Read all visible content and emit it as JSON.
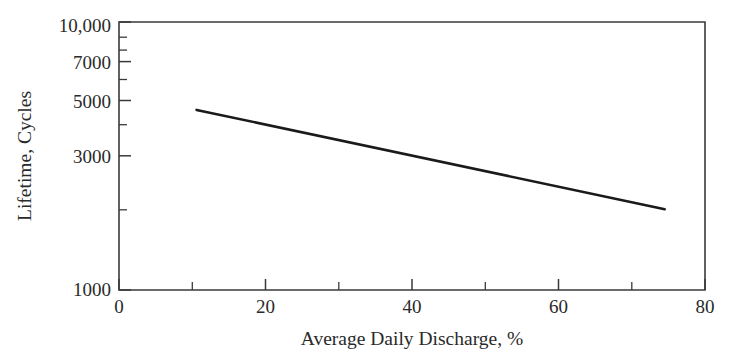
{
  "chart_data": {
    "type": "line",
    "title": "",
    "xlabel": "Average Daily Discharge, %",
    "ylabel": "Lifetime, Cycles",
    "xlim": [
      0,
      80
    ],
    "ylim": [
      1000,
      10000
    ],
    "yscale": "log",
    "xscale": "linear",
    "grid": false,
    "legend": null,
    "xticks": [
      0,
      20,
      40,
      60,
      80
    ],
    "xtick_labels": [
      "0",
      "20",
      "40",
      "60",
      "80"
    ],
    "xticks_minor": [
      10,
      30,
      50,
      70
    ],
    "yticks": [
      1000,
      3000,
      5000,
      7000,
      10000
    ],
    "ytick_labels": [
      "1000",
      "3000",
      "5000",
      "7000",
      "10,000"
    ],
    "yticks_minor": [
      2000,
      4000,
      6000,
      8000,
      9000
    ],
    "series": [
      {
        "name": "Battery lifetime vs average daily discharge",
        "x": [
          10.6,
          74.5
        ],
        "values": [
          4700,
          2000
        ]
      }
    ]
  },
  "figure": {
    "axis_color": "#3a3a3a",
    "line_color": "#1a1a1a",
    "background": "#ffffff"
  }
}
